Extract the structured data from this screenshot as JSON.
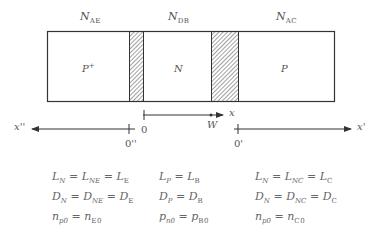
{
  "doping_labels": {
    "emitter": {
      "main": "N",
      "sub": "AE"
    },
    "base": {
      "main": "N",
      "sub": "DB"
    },
    "collector": {
      "main": "N",
      "sub": "AC"
    }
  },
  "regions": {
    "emitter": {
      "main": "P",
      "sup": "+"
    },
    "base": "N",
    "collector": "P"
  },
  "axes": {
    "base_axis": {
      "origin": "0",
      "end": "W",
      "label": "x"
    },
    "emitter_axis": {
      "origin": "0''",
      "label": "x''"
    },
    "collector_axis": {
      "origin": "0'",
      "label": "x'"
    }
  },
  "equations": {
    "emitter": [
      "L_N = L_NE = L_E",
      "D_N = D_NE = D_E",
      "n_p0 = n_E0"
    ],
    "base": [
      "L_P = L_B",
      "D_P = D_B",
      "p_n0 = p_B0"
    ],
    "collector": [
      "L_N = L_NC = L_C",
      "D_N = D_NC = D_C",
      "n_p0 = n_C0"
    ]
  },
  "colors": {
    "line": "#333333",
    "text": "#555555"
  }
}
